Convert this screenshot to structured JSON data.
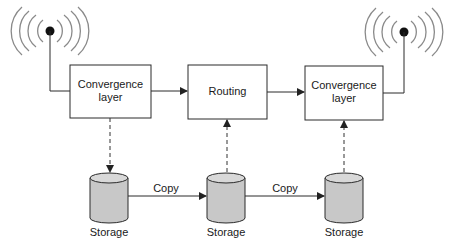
{
  "diagram": {
    "nodes": {
      "convergence_left": {
        "label_line1": "Convergence",
        "label_line2": "layer"
      },
      "routing": {
        "label": "Routing"
      },
      "convergence_right": {
        "label_line1": "Convergence",
        "label_line2": "layer"
      },
      "storage_left": {
        "label": "Storage"
      },
      "storage_middle": {
        "label": "Storage"
      },
      "storage_right": {
        "label": "Storage"
      }
    },
    "edges": {
      "copy_1": {
        "label": "Copy"
      },
      "copy_2": {
        "label": "Copy"
      }
    },
    "icons": {
      "left_antenna": "antenna-icon",
      "right_antenna": "antenna-icon"
    },
    "colors": {
      "line": "#2a2a2a",
      "cylinder_fill": "#c8c8c8",
      "cylinder_top": "#d8d8d8",
      "wave": "#8a8a8a"
    }
  }
}
